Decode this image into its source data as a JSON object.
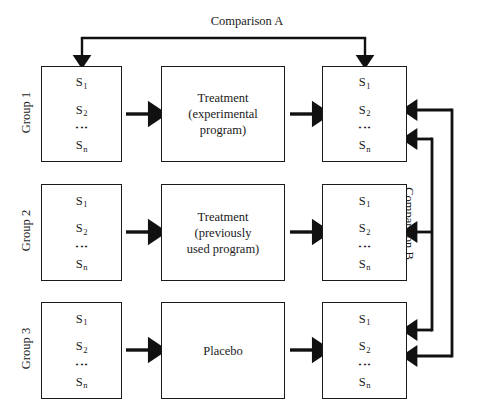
{
  "figure": {
    "type": "experimental-design-flow-diagram",
    "background": "#ffffff",
    "ink": "#1a1a1a",
    "width": 494,
    "height": 420
  },
  "comparisons": {
    "a": {
      "label": "Comparison A",
      "direction": "down",
      "connects": [
        "group1-pretest",
        "group1-posttest"
      ]
    },
    "b": {
      "label": "Comparison B",
      "direction": "left",
      "connects": [
        "group1-posttest",
        "group2-posttest",
        "group3-posttest"
      ]
    }
  },
  "subjects": {
    "s1": "S",
    "s1_sub": "1",
    "s2": "S",
    "s2_sub": "2",
    "sn": "S",
    "sn_sub": "n",
    "ellipsis": "⋮"
  },
  "rows": [
    {
      "group_label": "Group 1",
      "pre_box": "subject-list",
      "treatment_lines": [
        "Treatment",
        "(experimental",
        "program)"
      ],
      "post_box": "subject-list"
    },
    {
      "group_label": "Group 2",
      "pre_box": "subject-list",
      "treatment_lines": [
        "Treatment",
        "(previously",
        "used program)"
      ],
      "post_box": "subject-list"
    },
    {
      "group_label": "Group 3",
      "pre_box": "subject-list",
      "treatment_lines": [
        "Placebo"
      ],
      "post_box": "subject-list"
    }
  ]
}
